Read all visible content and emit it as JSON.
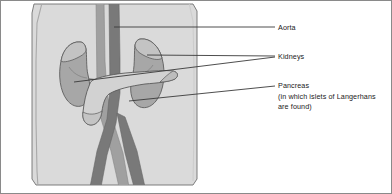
{
  "figure": {
    "type": "labelled-anatomical-illustration",
    "panel_background_color": "#d8d8d8",
    "outline_color": "#555555",
    "leader_line_color": "#3a3a3a",
    "text_color": "#1a1a1a"
  },
  "labels": {
    "aorta": {
      "text": "Aorta",
      "leader_target": "vertical-vessel-upper"
    },
    "kidneys": {
      "text": "Kidneys",
      "leader_target": "left-kidney-and-right-kidney"
    },
    "pancreas": {
      "text": "Pancreas",
      "note_line_1": "(in which islets of Langerhans",
      "note_line_2": "are found)",
      "leader_target": "pancreas-body"
    }
  },
  "structures": {
    "aorta_color": "#7d7d7d",
    "vena_cava_color": "#9a9a9a",
    "kidney_fill": "#a9a9a9",
    "kidney_shadow": "#8f8f8f",
    "adrenal_fill": "#c2c2c2",
    "pancreas_fill": "#cfcfcf",
    "pancreas_shadow": "#bdbdbd",
    "body_outline": "#9e9e9e"
  }
}
